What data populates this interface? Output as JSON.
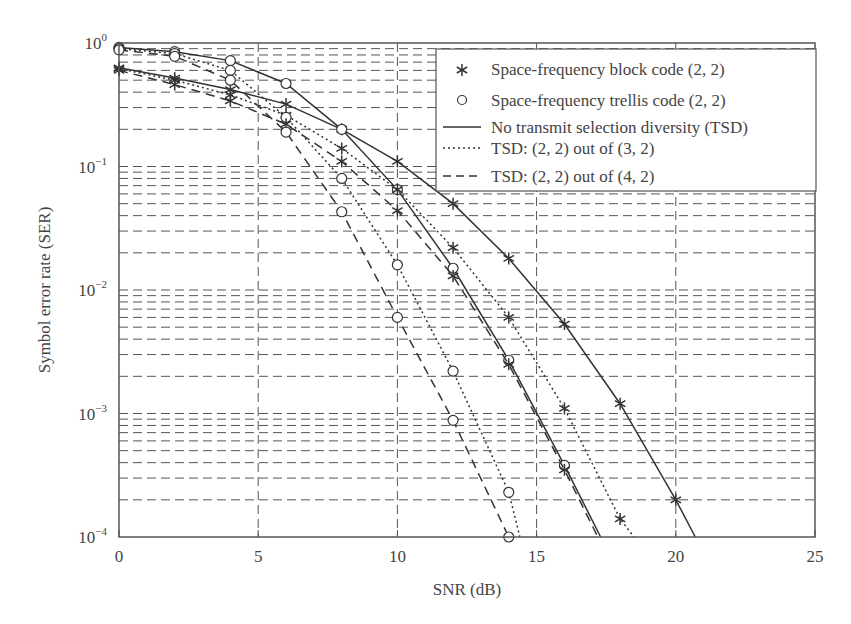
{
  "chart_data": {
    "type": "line",
    "title": "",
    "xlabel": "SNR (dB)",
    "ylabel": "Symbol error rate (SER)",
    "xlim": [
      0,
      25
    ],
    "ylim": [
      0.0001,
      1
    ],
    "yscale": "log",
    "grid": true,
    "x_ticks": [
      0,
      5,
      10,
      15,
      20,
      25
    ],
    "y_ticks": [
      "10^0",
      "10^-1",
      "10^-2",
      "10^-3",
      "10^-4"
    ],
    "legend_position": "upper right",
    "legend": [
      {
        "marker": "*",
        "label": "Space-frequency block code (2, 2)"
      },
      {
        "marker": "o",
        "label": "Space-frequency trellis code (2, 2)"
      },
      {
        "line": "solid",
        "label": "No transmit selection diversity (TSD)"
      },
      {
        "line": "dotted",
        "label": "TSD: (2, 2) out of (3, 2)"
      },
      {
        "line": "dashed",
        "label": "TSD: (2, 2) out of (4, 2)"
      }
    ],
    "series": [
      {
        "name": "SFBC (2,2), No TSD",
        "marker": "*",
        "line": "solid",
        "x": [
          0,
          2,
          4,
          6,
          8,
          10,
          12,
          14,
          16,
          18,
          20
        ],
        "values": [
          0.63,
          0.52,
          0.42,
          0.32,
          0.2,
          0.11,
          0.05,
          0.018,
          0.0053,
          0.0012,
          0.0002
        ]
      },
      {
        "name": "SFTC (2,2), No TSD",
        "marker": "o",
        "line": "solid",
        "x": [
          0,
          2,
          4,
          6,
          8,
          10,
          12,
          14,
          16
        ],
        "values": [
          0.92,
          0.85,
          0.72,
          0.47,
          0.2,
          0.065,
          0.015,
          0.0027,
          0.00038
        ]
      },
      {
        "name": "SFBC (2,2), TSD (2,2) out of (3,2)",
        "marker": "*",
        "line": "dotted",
        "x": [
          0,
          2,
          4,
          6,
          8,
          10,
          12,
          14,
          16,
          18
        ],
        "values": [
          0.62,
          0.5,
          0.38,
          0.26,
          0.14,
          0.065,
          0.022,
          0.006,
          0.0011,
          0.00014
        ]
      },
      {
        "name": "SFTC (2,2), TSD (2,2) out of (3,2)",
        "marker": "o",
        "line": "dotted",
        "x": [
          0,
          2,
          4,
          6,
          8,
          10,
          12,
          14
        ],
        "values": [
          0.9,
          0.82,
          0.6,
          0.25,
          0.08,
          0.016,
          0.0022,
          0.00023
        ]
      },
      {
        "name": "SFBC (2,2), TSD (2,2) out of (4,2)",
        "marker": "*",
        "line": "dashed",
        "x": [
          0,
          2,
          4,
          6,
          8,
          10,
          12,
          14,
          16
        ],
        "values": [
          0.6,
          0.46,
          0.34,
          0.22,
          0.11,
          0.044,
          0.013,
          0.0025,
          0.00035
        ]
      },
      {
        "name": "SFTC (2,2), TSD (2,2) out of (4,2)",
        "marker": "o",
        "line": "dashed",
        "x": [
          0,
          2,
          4,
          6,
          8,
          10,
          12,
          14
        ],
        "values": [
          0.88,
          0.78,
          0.5,
          0.19,
          0.043,
          0.006,
          0.00088,
          0.0001
        ]
      }
    ],
    "extensions": [
      {
        "series": 0,
        "to_x": 20.7,
        "to_y": 0.0001
      },
      {
        "series": 1,
        "to_x": 17.3,
        "to_y": 0.0001
      },
      {
        "series": 2,
        "to_x": 18.5,
        "to_y": 0.0001
      },
      {
        "series": 3,
        "to_x": 14.4,
        "to_y": 0.0001
      },
      {
        "series": 4,
        "to_x": 17.2,
        "to_y": 0.0001
      }
    ]
  },
  "axes": {
    "x_label": "SNR (dB)",
    "y_label": "Symbol error rate (SER)",
    "x_tick_labels": [
      "0",
      "5",
      "10",
      "15",
      "20",
      "25"
    ],
    "y_tick_base": "10",
    "y_tick_exponents": [
      "0",
      "−1",
      "−2",
      "−3",
      "−4"
    ]
  },
  "legend": {
    "items": [
      "Space-frequency block code (2, 2)",
      "Space-frequency trellis code (2, 2)",
      "No transmit selection diversity (TSD)",
      "TSD: (2, 2) out of (3, 2)",
      "TSD: (2, 2) out of (4, 2)"
    ]
  },
  "colors": {
    "line": "#333333",
    "grid": "#555555",
    "frame": "#555555"
  }
}
